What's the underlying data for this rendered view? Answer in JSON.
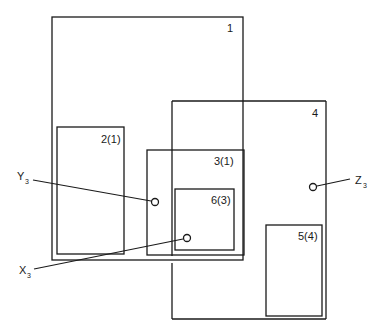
{
  "diagram": {
    "boxes": [
      {
        "id": "1",
        "label": "1"
      },
      {
        "id": "2",
        "label": "2(1)"
      },
      {
        "id": "3",
        "label": "3(1)"
      },
      {
        "id": "4",
        "label": "4"
      },
      {
        "id": "5",
        "label": "5(4)"
      },
      {
        "id": "6",
        "label": "6(3)"
      }
    ],
    "points": [
      {
        "id": "Y3",
        "letter": "Y",
        "subscript": "3"
      },
      {
        "id": "X3",
        "letter": "X",
        "subscript": "3"
      },
      {
        "id": "Z3",
        "letter": "Z",
        "subscript": "3"
      }
    ]
  }
}
